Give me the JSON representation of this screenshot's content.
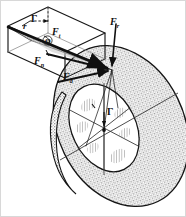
{
  "figure": {
    "width": 186,
    "height": 217,
    "background": "#ffffff",
    "ink_color": "#101010",
    "disk_fill": "#cfcfcf",
    "wedge_fill": "#b9b9b9",
    "hatch_color": "#707070"
  },
  "labels": {
    "radius": "r",
    "circulation_top": "Γ",
    "force_tangential": "F",
    "force_tangential_sub": "t",
    "force_normal": "F",
    "force_normal_sub": "n",
    "force_axial": "F",
    "force_axial_sub": "a",
    "force_resultant": "F",
    "force_resultant_sub": "r",
    "angle_phi": "φ",
    "circulation_center": "Γ"
  },
  "elements": {
    "prism_name": "blade-element-prism",
    "disk_name": "rotor-disk",
    "inner_ellipse_name": "rotor-hub-ellipse",
    "sector_count": 6,
    "vector_names": [
      "force-tangential-vector",
      "force-normal-vector",
      "force-axial-vector",
      "force-resultant-vector",
      "circulation-arrow-top",
      "circulation-arrow-center"
    ]
  }
}
